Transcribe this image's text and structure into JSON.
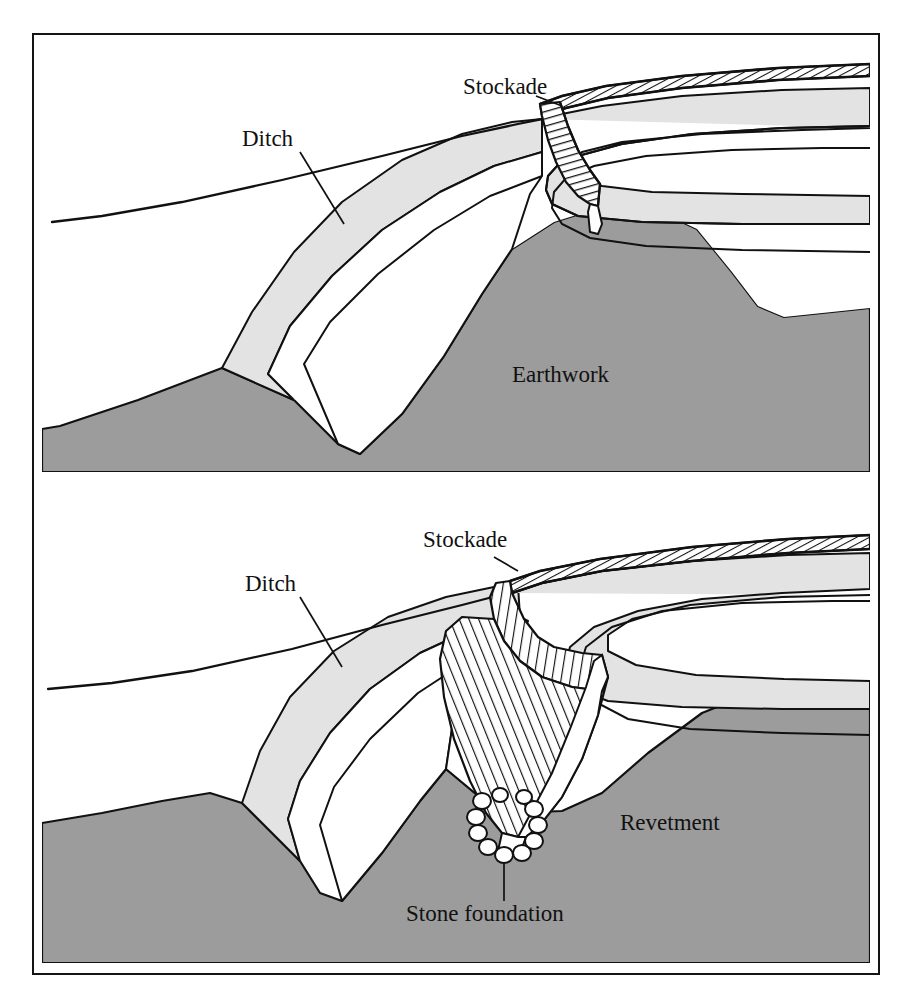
{
  "figure": {
    "title": "CELTIC RAMPARTS",
    "frame_color": "#141414",
    "background_color": "#ffffff",
    "earth_fill": "#9c9c9c",
    "bank_fill": "#e3e3e3",
    "white_fill": "#ffffff",
    "line_color": "#111111"
  },
  "panels": [
    {
      "id": "upper",
      "name": "dump-rampart-with-stockade",
      "labels": [
        {
          "key": "stockade",
          "text": "Stockade",
          "x": 428,
          "y": 72,
          "leader": true
        },
        {
          "key": "ditch",
          "text": "Ditch",
          "x": 235,
          "y": 130,
          "leader": true
        },
        {
          "key": "earthwork",
          "text": "Earthwork",
          "x": 512,
          "y": 348,
          "leader": false
        }
      ]
    },
    {
      "id": "lower",
      "name": "timber-revetted-rampart",
      "labels": [
        {
          "key": "stockade",
          "text": "Stockade",
          "x": 388,
          "y": 540,
          "leader": true
        },
        {
          "key": "ditch",
          "text": "Ditch",
          "x": 238,
          "y": 620,
          "leader": true
        },
        {
          "key": "revetment",
          "text": "Revetment",
          "x": 620,
          "y": 800,
          "leader": false
        },
        {
          "key": "stone_foundation",
          "text": "Stone foundation",
          "x": 406,
          "y": 884,
          "leader": true
        }
      ]
    }
  ]
}
